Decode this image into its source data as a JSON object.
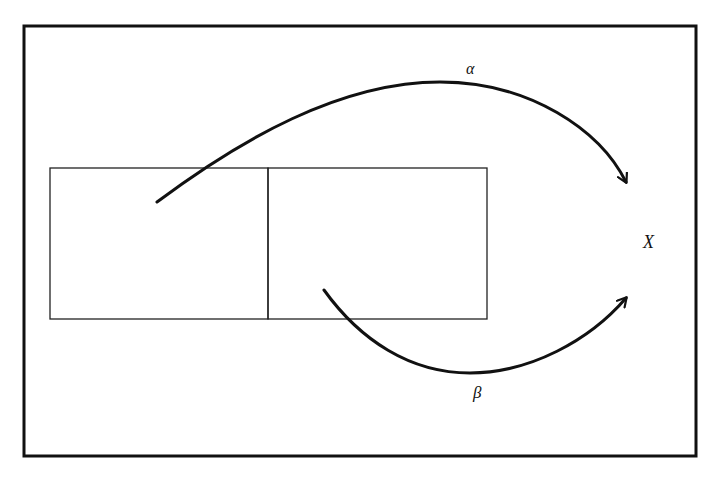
{
  "diagram": {
    "labels": {
      "alpha": "α",
      "beta": "β",
      "target": "X"
    },
    "colors": {
      "stroke": "#111111",
      "background": "#ffffff"
    },
    "elements": [
      {
        "id": "outer-frame",
        "type": "rectangle"
      },
      {
        "id": "inner-box-left",
        "type": "rectangle"
      },
      {
        "id": "inner-box-right",
        "type": "rectangle"
      },
      {
        "id": "arrow-alpha",
        "type": "curved-arrow",
        "from": "inner-box-left",
        "to": "X",
        "label": "α"
      },
      {
        "id": "arrow-beta",
        "type": "curved-arrow",
        "from": "inner-box-right",
        "to": "X",
        "label": "β"
      }
    ]
  }
}
